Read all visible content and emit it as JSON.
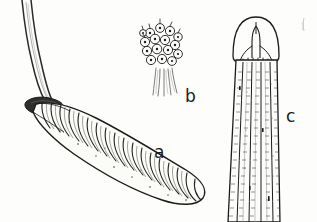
{
  "plate": {
    "kind": "scientific-line-illustration",
    "medium": "pen-and-ink hatched drawing",
    "background_color": "#fdfdfb",
    "ink_color": "#1b1b1b",
    "width_px": 317,
    "height_px": 222,
    "subject": "botanical / bryophyte sporophyte plate with three lettered figures"
  },
  "labels": [
    {
      "id": "a",
      "text": "a",
      "x": 154,
      "y": 144,
      "refers_to": "elongated ribbed capsule on curved seta"
    },
    {
      "id": "b",
      "text": "b",
      "x": 185,
      "y": 88,
      "refers_to": "cluster of stalked spherical bodies"
    },
    {
      "id": "c",
      "text": "c",
      "x": 286,
      "y": 108,
      "refers_to": "tubular apex with longitudinal cell rows"
    }
  ],
  "figures": {
    "a": {
      "label": "a",
      "description": "Long curved seta descending from top-left into a dark wedge-shaped base, bearing a downward-sloping elongate ribbed and wrinkled capsule with about twenty transverse segments, tapering to a rounded tip at lower right.",
      "parts": [
        {
          "name": "seta",
          "note": "slender double-lined stalk curving from upper-left edge"
        },
        {
          "name": "apophysis",
          "note": "dark solid-shaded wedge at the stalk base"
        },
        {
          "name": "capsule",
          "note": "ribbed, transversely wrinkled elongate body"
        }
      ],
      "segment_count": 20
    },
    "b": {
      "label": "b",
      "description": "Dense cluster of about sixteen small spheres, each drawn with an outline and a central dot, massed on a bundle of fine vertical stalks.",
      "parts": [
        {
          "name": "spherical-bodies",
          "note": "round outlined cells each with a central dot"
        },
        {
          "name": "stalk-bundle",
          "note": "fine parallel vertical lines below the cluster"
        }
      ],
      "sphere_count": 16
    },
    "c": {
      "label": "c",
      "description": "Tubular structure with a rounded dome-shaped apex containing a central slit that splays into short teeth, below which run four longitudinal cell rows textured with fine transverse cross-ticks; the structure runs off the lower edge of the plate.",
      "parts": [
        {
          "name": "dome-apex",
          "note": "rounded cap outline"
        },
        {
          "name": "central-slit",
          "note": "narrow vertical opening branching into teeth"
        },
        {
          "name": "longitudinal-rows",
          "note": "four parallel cell files with cross-ticks"
        }
      ],
      "row_count": 4
    }
  },
  "marks": [
    {
      "name": "corner-tick",
      "note": "faint short stroke near the upper-right corner",
      "x": 303,
      "y": 24
    }
  ]
}
